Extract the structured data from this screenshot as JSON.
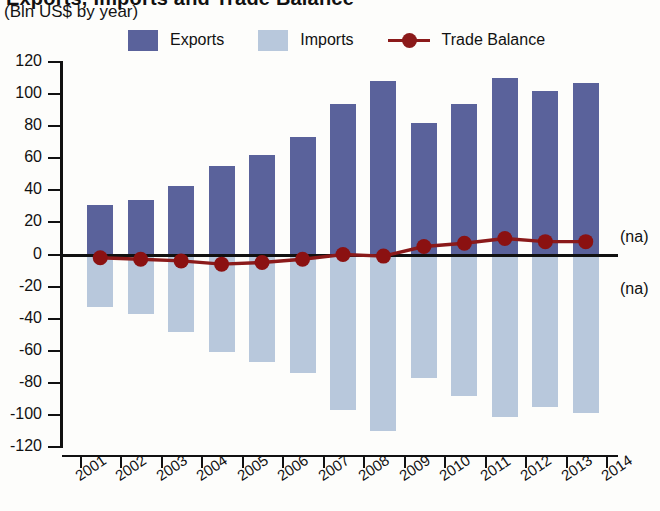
{
  "header": {
    "title_clipped": "Exports, Imports and Trade Balance",
    "subtitle": "(Bln US$ by year)"
  },
  "legend": {
    "items": [
      {
        "label": "Exports",
        "color": "#5a629b",
        "marker": "square"
      },
      {
        "label": "Imports",
        "color": "#b8c8dc",
        "marker": "square"
      },
      {
        "label": "Trade Balance",
        "color": "#8b1a1a",
        "marker": "line-circle"
      }
    ]
  },
  "annotations": [
    {
      "text": "(na)",
      "value": 10
    },
    {
      "text": "(na)",
      "value": -22
    }
  ],
  "axis": {
    "y_ticks": [
      120,
      100,
      80,
      60,
      40,
      20,
      0,
      -20,
      -40,
      -60,
      -80,
      -100,
      -120
    ],
    "y_tick_labels": [
      "120",
      "100",
      "80",
      "60",
      "40",
      "20",
      "0",
      "-20",
      "-40",
      "-60",
      "-80",
      "-100",
      "-120"
    ],
    "x_tick_labels": [
      "2001",
      "2002",
      "2003",
      "2004",
      "2005",
      "2006",
      "2007",
      "2008",
      "2009",
      "2010",
      "2011",
      "2012",
      "2013",
      "2014"
    ]
  },
  "chart_data": {
    "type": "bar",
    "title": "Exports, Imports and Trade Balance",
    "subtitle": "(Bln US$ by year)",
    "xlabel": "",
    "ylabel": "Bln US$",
    "ylim": [
      -120,
      120
    ],
    "ytick_step": 20,
    "grid": false,
    "legend_position": "top",
    "categories": [
      "2001",
      "2002",
      "2003",
      "2004",
      "2005",
      "2006",
      "2007",
      "2008",
      "2009",
      "2010",
      "2011",
      "2012",
      "2013",
      "2014"
    ],
    "series": [
      {
        "name": "Exports",
        "type": "bar",
        "color": "#5a629b",
        "values": [
          31,
          34,
          43,
          55,
          62,
          73,
          94,
          108,
          82,
          94,
          110,
          102,
          107,
          null
        ]
      },
      {
        "name": "Imports",
        "type": "bar",
        "color": "#b8c8dc",
        "values": [
          -33,
          -37,
          -48,
          -61,
          -67,
          -74,
          -97,
          -110,
          -77,
          -88,
          -101,
          -95,
          -99,
          null
        ]
      },
      {
        "name": "Trade Balance",
        "type": "line",
        "color": "#8b1a1a",
        "values": [
          -2,
          -3,
          -4,
          -6,
          -5,
          -3,
          0,
          -1,
          5,
          7,
          10,
          8,
          8,
          null
        ]
      }
    ]
  }
}
